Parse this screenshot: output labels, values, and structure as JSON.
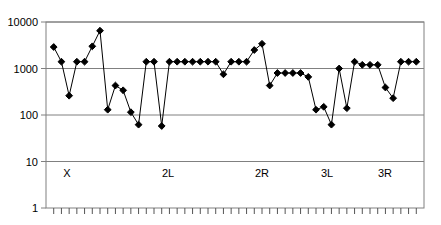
{
  "chart_data": {
    "type": "line",
    "title": "",
    "xlabel": "",
    "ylabel": "",
    "yscale": "log",
    "ylim": [
      1,
      10000
    ],
    "ytick_labels": [
      "1",
      "10",
      "100",
      "1000",
      "10000"
    ],
    "ytick_values": [
      1,
      10,
      100,
      1000,
      10000
    ],
    "grid": true,
    "gridlines": [
      10,
      100,
      1000,
      10000
    ],
    "legend": "none",
    "marker": "diamond",
    "marker_color": "#000000",
    "line_color": "#000000",
    "axis_color": "#808080",
    "background": "#ffffff",
    "category_labels": [
      "X",
      "2L",
      "2R",
      "3L",
      "3R"
    ],
    "category_label_x": [
      67,
      168,
      262,
      327,
      385
    ],
    "n_points": 48,
    "x": [
      1,
      2,
      3,
      4,
      5,
      6,
      7,
      8,
      9,
      10,
      11,
      12,
      13,
      14,
      15,
      16,
      17,
      18,
      19,
      20,
      21,
      22,
      23,
      24,
      25,
      26,
      27,
      28,
      29,
      30,
      31,
      32,
      33,
      34,
      35,
      36,
      37,
      38,
      39,
      40,
      41,
      42,
      43,
      44,
      45,
      46,
      47,
      48
    ],
    "values": [
      2900,
      1400,
      260,
      1400,
      1400,
      3000,
      6500,
      130,
      430,
      340,
      115,
      62,
      1400,
      1400,
      58,
      1400,
      1400,
      1400,
      1400,
      1400,
      1400,
      1400,
      750,
      1400,
      1400,
      1400,
      2500,
      3400,
      430,
      800,
      800,
      800,
      800,
      660,
      130,
      150,
      62,
      1000,
      140,
      1400,
      1200,
      1200,
      1200,
      390,
      230,
      1400,
      1400,
      1400
    ],
    "series": [
      {
        "name": "",
        "values": [
          2900,
          1400,
          260,
          1400,
          1400,
          3000,
          6500,
          130,
          430,
          340,
          115,
          62,
          1400,
          1400,
          58,
          1400,
          1400,
          1400,
          1400,
          1400,
          1400,
          1400,
          750,
          1400,
          1400,
          1400,
          2500,
          3400,
          430,
          800,
          800,
          800,
          800,
          660,
          130,
          150,
          62,
          1000,
          140,
          1400,
          1200,
          1200,
          1200,
          390,
          230,
          1400,
          1400,
          1400
        ]
      }
    ],
    "n_xaxis_ticks": 48,
    "plot_area": {
      "left": 46,
      "right": 424,
      "top": 22,
      "bottom": 208
    }
  },
  "axis": {
    "y_labels": [
      "10000",
      "1000",
      "100",
      "10",
      "1"
    ]
  },
  "categories": {
    "items": [
      {
        "label": "X"
      },
      {
        "label": "2L"
      },
      {
        "label": "2R"
      },
      {
        "label": "3L"
      },
      {
        "label": "3R"
      }
    ]
  }
}
